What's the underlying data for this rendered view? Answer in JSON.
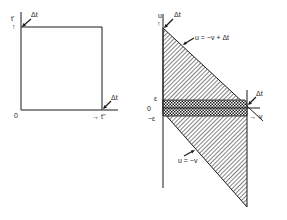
{
  "figure": {
    "left_panel": {
      "y_axis_label": "t'",
      "x_axis_label": "t''",
      "origin_label": "0",
      "top_corner_label": "Δt",
      "right_corner_label": "Δt"
    },
    "right_panel": {
      "y_axis_label": "u",
      "x_axis_label": "v",
      "origin_label": "0",
      "epsilon_label": "ε",
      "neg_epsilon_label": "−ε",
      "top_label": "Δt",
      "right_label": "Δt",
      "upper_line_label": "u = −v + Δt",
      "lower_line_label": "u = −v"
    },
    "colors": {
      "stroke": "#1a1a1a",
      "background": "#ffffff"
    }
  }
}
